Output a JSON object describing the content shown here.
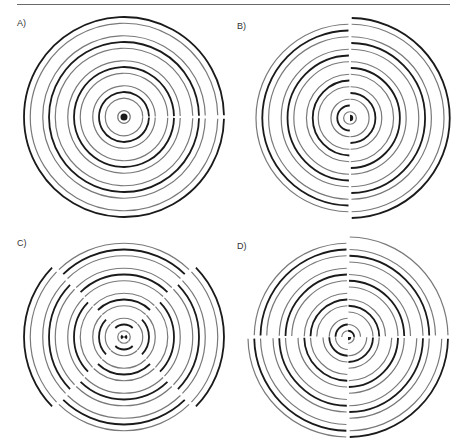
{
  "figure": {
    "panels": [
      {
        "id": "A",
        "label": "A)",
        "pattern": "concentric",
        "sectors": [
          {
            "from_deg": 0,
            "to_deg": 360,
            "phase": 0
          }
        ]
      },
      {
        "id": "B",
        "label": "B)",
        "pattern": "half-split",
        "sectors": [
          {
            "from_deg": -90,
            "to_deg": 90,
            "phase": 0
          },
          {
            "from_deg": 90,
            "to_deg": 270,
            "phase": 0.5
          }
        ]
      },
      {
        "id": "C",
        "label": "C)",
        "pattern": "quarter-split-opposed",
        "sectors": [
          {
            "from_deg": -45,
            "to_deg": 45,
            "phase": 0
          },
          {
            "from_deg": 45,
            "to_deg": 135,
            "phase": 0.5
          },
          {
            "from_deg": 135,
            "to_deg": 225,
            "phase": 0
          },
          {
            "from_deg": 225,
            "to_deg": 315,
            "phase": 0.5
          }
        ]
      },
      {
        "id": "D",
        "label": "D)",
        "pattern": "quadrant-stepped",
        "sectors": [
          {
            "from_deg": 0,
            "to_deg": 90,
            "phase": 0
          },
          {
            "from_deg": 90,
            "to_deg": 180,
            "phase": 0.25
          },
          {
            "from_deg": 180,
            "to_deg": 270,
            "phase": 0.5
          },
          {
            "from_deg": 270,
            "to_deg": 360,
            "phase": 0.75
          }
        ]
      }
    ],
    "ring_colors": {
      "dark": "#1a1a1a",
      "light": "#d8d8d8"
    },
    "ring_cycles": 4
  }
}
